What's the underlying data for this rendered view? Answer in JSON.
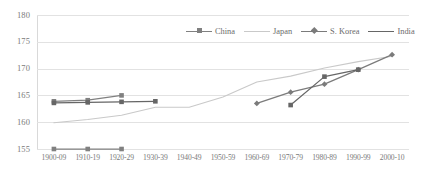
{
  "chart_data": {
    "type": "line",
    "title": "",
    "xlabel": "",
    "ylabel": "",
    "ylim": [
      155,
      180
    ],
    "yticks": [
      155,
      160,
      165,
      170,
      175,
      180
    ],
    "grid": true,
    "legend_position": "top-center",
    "categories": [
      "1900-09",
      "1910-19",
      "1920-29",
      "1930-39",
      "1940-49",
      "1950-59",
      "1960-69",
      "1970-79",
      "1980-89",
      "1990-99",
      "2000-10"
    ],
    "series": [
      {
        "name": "China",
        "color": "#808080",
        "marker": "square",
        "values": [
          163.9,
          164.1,
          165.0,
          null,
          null,
          null,
          null,
          null,
          null,
          null,
          null
        ]
      },
      {
        "name": "Japan",
        "color": "#c9c9c9",
        "marker": "none",
        "values": [
          159.9,
          160.5,
          161.3,
          162.8,
          162.8,
          164.7,
          167.5,
          168.6,
          170.1,
          171.3,
          172.3
        ]
      },
      {
        "name": "S. Korea",
        "color": "#7b7b7b",
        "marker": "diamond",
        "values": [
          null,
          null,
          null,
          null,
          null,
          null,
          163.5,
          165.6,
          167.1,
          169.8,
          172.6
        ]
      },
      {
        "name": "India",
        "color": "#666666",
        "marker": "square",
        "values": [
          163.6,
          163.7,
          163.8,
          163.9,
          null,
          null,
          null,
          163.2,
          168.5,
          169.8,
          null
        ]
      },
      {
        "name": "India-baseline",
        "color": "#808080",
        "marker": "square",
        "values": [
          155.0,
          155.0,
          155.0,
          null,
          null,
          null,
          null,
          null,
          null,
          null,
          null
        ]
      }
    ]
  },
  "legend": {
    "items": [
      {
        "label": "China",
        "marker": "square",
        "color": "#808080"
      },
      {
        "label": "Japan",
        "marker": "none",
        "color": "#c9c9c9"
      },
      {
        "label": "S. Korea",
        "marker": "diamond",
        "color": "#7b7b7b"
      },
      {
        "label": "India",
        "marker": "none",
        "color": "#666666"
      }
    ]
  },
  "axes": {
    "y_tick_labels": [
      "180",
      "175",
      "170",
      "165",
      "160",
      "155"
    ],
    "x_tick_labels": [
      "1900-09",
      "1910-19",
      "1920-29",
      "1930-39",
      "1940-49",
      "1950-59",
      "1960-69",
      "1970-79",
      "1980-89",
      "1990-99",
      "2000-10"
    ]
  }
}
